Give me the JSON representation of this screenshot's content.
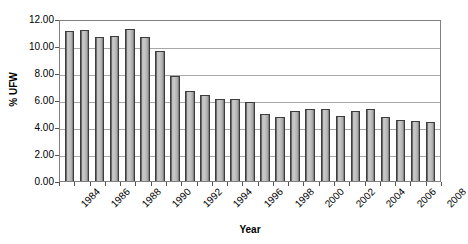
{
  "chart_data": {
    "type": "bar",
    "title": "",
    "xlabel": "Year",
    "ylabel": "% UFW",
    "categories": [
      "1984",
      "1985",
      "1986",
      "1987",
      "1988",
      "1989",
      "1990",
      "1991",
      "1992",
      "1993",
      "1994",
      "1995",
      "1996",
      "1997",
      "1998",
      "1999",
      "2000",
      "2001",
      "2002",
      "2003",
      "2004",
      "2005",
      "2006",
      "2007",
      "2008"
    ],
    "values": [
      11.1,
      11.2,
      10.7,
      10.75,
      11.25,
      10.65,
      9.6,
      7.8,
      6.7,
      6.4,
      6.05,
      6.1,
      5.85,
      4.95,
      4.75,
      5.2,
      5.3,
      5.35,
      4.85,
      5.15,
      5.35,
      4.75,
      4.55,
      4.45,
      4.4
    ],
    "ylim": [
      0,
      12
    ],
    "ytick_labels": [
      "12.00",
      "10.00",
      "8.00",
      "6.00",
      "4.00",
      "2.00",
      "0.00"
    ],
    "ytick_values": [
      12,
      10,
      8,
      6,
      4,
      2,
      0
    ],
    "xtick_labels": [
      "1984",
      "1986",
      "1988",
      "1990",
      "1992",
      "1994",
      "1996",
      "1998",
      "2000",
      "2002",
      "2004",
      "2006",
      "2008"
    ],
    "xtick_indices": [
      0,
      2,
      4,
      6,
      8,
      10,
      12,
      14,
      16,
      18,
      20,
      22,
      24
    ],
    "grid": true,
    "legend": null,
    "legend_position": "none",
    "bar_fill_color": "#c0c0c0",
    "bar_border_color": "#3d3d3d",
    "grid_color": "#a8a8a8",
    "plot_border_color": "#808080",
    "background_color": "#ffffff"
  }
}
